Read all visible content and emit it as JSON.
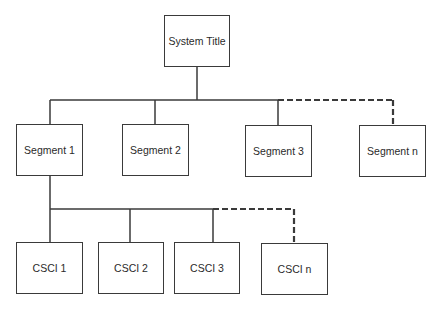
{
  "diagram": {
    "type": "hierarchy",
    "root": {
      "label": "System Title"
    },
    "segments": [
      {
        "label": "Segment 1",
        "connector": "solid"
      },
      {
        "label": "Segment 2",
        "connector": "solid"
      },
      {
        "label": "Segment 3",
        "connector": "solid"
      },
      {
        "label": "Segment n",
        "connector": "dashed"
      }
    ],
    "cscis": {
      "parent": "Segment 1",
      "items": [
        {
          "label": "CSCI 1",
          "connector": "solid"
        },
        {
          "label": "CSCI 2",
          "connector": "solid"
        },
        {
          "label": "CSCI 3",
          "connector": "solid"
        },
        {
          "label": "CSCI n",
          "connector": "dashed"
        }
      ]
    },
    "colors": {
      "line": "#3a3a3a",
      "box_fill": "#ffffff",
      "text": "#2a2a2a"
    }
  }
}
